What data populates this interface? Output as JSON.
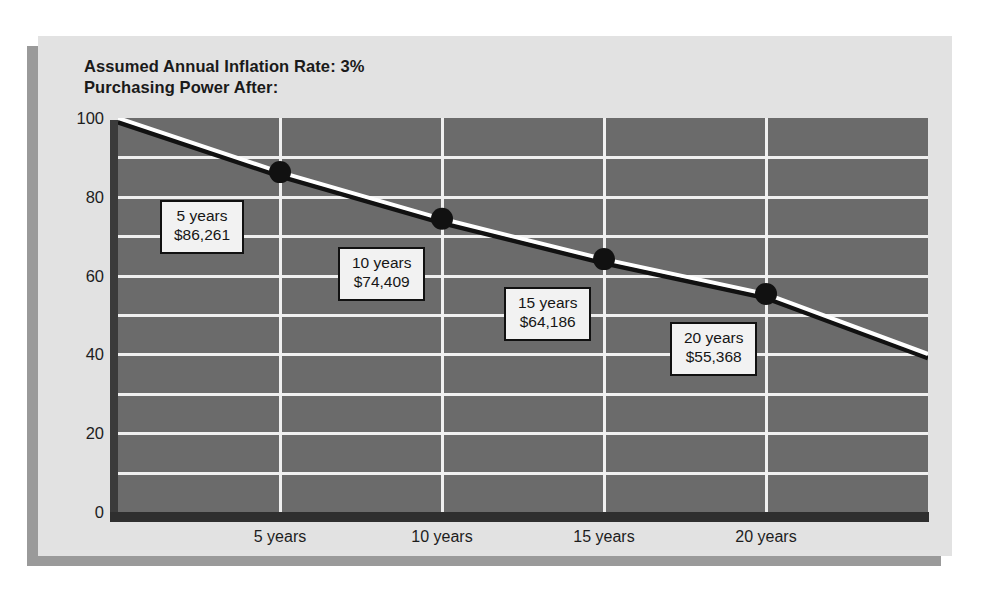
{
  "chart_data": {
    "type": "line",
    "title": "Assumed Annual Inflation Rate: 3%",
    "subtitle": "Purchasing Power After:",
    "xlabel": "",
    "ylabel": "",
    "ylim": [
      0,
      100
    ],
    "ytick_step": 20,
    "gridline_step": 10,
    "grid": true,
    "legend": "none",
    "categories": [
      "5 years",
      "10 years",
      "15 years",
      "20 years"
    ],
    "x": [
      5,
      10,
      15,
      20
    ],
    "values": [
      86.261,
      74.409,
      64.186,
      55.368
    ],
    "start_value": 100,
    "end_value": 40.101,
    "yticks": [
      "0",
      "20",
      "40",
      "60",
      "80",
      "100"
    ],
    "point_labels": [
      {
        "period": "5 years",
        "amount": "$86,261"
      },
      {
        "period": "10 years",
        "amount": "$74,409"
      },
      {
        "period": "15 years",
        "amount": "$64,186"
      },
      {
        "period": "20 years",
        "amount": "$55,368"
      }
    ],
    "colors": {
      "card_background": "#e2e2e2",
      "plot_background": "#6b6b6b",
      "gridline": "#efefef",
      "line": "#ffffff",
      "line_shadow": "#111111",
      "marker": "#111111",
      "text": "#1a1a1a",
      "callout_background": "#f2f2f2",
      "callout_border": "#111111",
      "wall": "#3b3b3b",
      "floor": "#2f2f2f"
    }
  }
}
